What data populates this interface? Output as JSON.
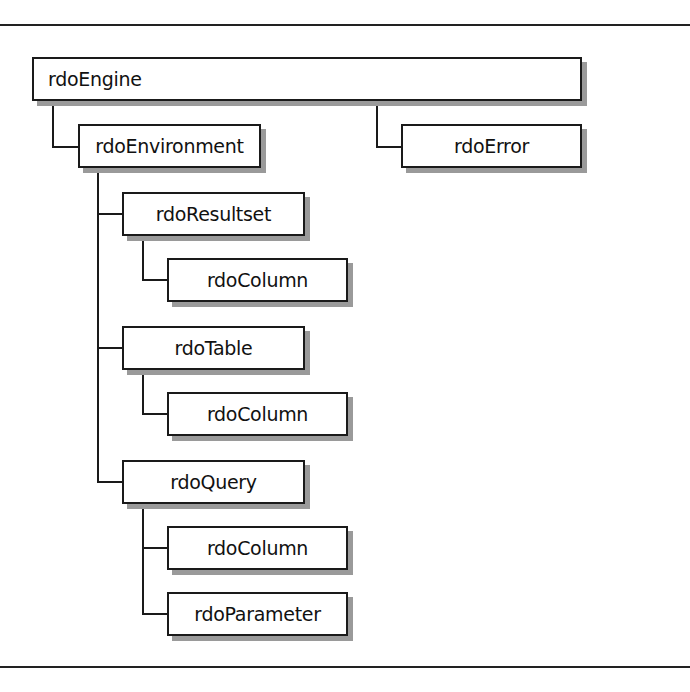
{
  "diagram": {
    "type": "object-hierarchy",
    "root": {
      "label": "rdoEngine",
      "children": [
        {
          "label": "rdoEnvironment",
          "children": [
            {
              "label": "rdoResultset",
              "children": [
                {
                  "label": "rdoColumn"
                }
              ]
            },
            {
              "label": "rdoTable",
              "children": [
                {
                  "label": "rdoColumn"
                }
              ]
            },
            {
              "label": "rdoQuery",
              "children": [
                {
                  "label": "rdoColumn"
                },
                {
                  "label": "rdoParameter"
                }
              ]
            }
          ]
        },
        {
          "label": "rdoError"
        }
      ]
    }
  },
  "nodes": {
    "engine": "rdoEngine",
    "environment": "rdoEnvironment",
    "error": "rdoError",
    "resultset": "rdoResultset",
    "resultset_column": "rdoColumn",
    "table": "rdoTable",
    "table_column": "rdoColumn",
    "query": "rdoQuery",
    "query_column": "rdoColumn",
    "query_parameter": "rdoParameter"
  }
}
